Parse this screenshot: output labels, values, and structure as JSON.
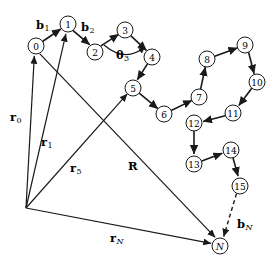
{
  "figure": {
    "width": 280,
    "height": 275,
    "background_color": "#ffffff",
    "stroke_color": "#1a1a1a"
  },
  "nodes": [
    {
      "id": "0",
      "label": "0",
      "cx": 36,
      "cy": 46,
      "r": 8
    },
    {
      "id": "1",
      "label": "1",
      "cx": 68,
      "cy": 24,
      "r": 8
    },
    {
      "id": "2",
      "label": "2",
      "cx": 95,
      "cy": 52,
      "r": 8
    },
    {
      "id": "3",
      "label": "3",
      "cx": 125,
      "cy": 30,
      "r": 8
    },
    {
      "id": "4",
      "label": "4",
      "cx": 152,
      "cy": 57,
      "r": 8
    },
    {
      "id": "5",
      "label": "5",
      "cx": 133,
      "cy": 88,
      "r": 8
    },
    {
      "id": "6",
      "label": "6",
      "cx": 164,
      "cy": 114,
      "r": 8
    },
    {
      "id": "7",
      "label": "7",
      "cx": 199,
      "cy": 97,
      "r": 8
    },
    {
      "id": "8",
      "label": "8",
      "cx": 207,
      "cy": 59,
      "r": 8
    },
    {
      "id": "9",
      "label": "9",
      "cx": 245,
      "cy": 45,
      "r": 8
    },
    {
      "id": "10",
      "label": "10",
      "cx": 257,
      "cy": 82,
      "r": 8
    },
    {
      "id": "11",
      "label": "11",
      "cx": 233,
      "cy": 113,
      "r": 8
    },
    {
      "id": "12",
      "label": "12",
      "cx": 194,
      "cy": 123,
      "r": 8
    },
    {
      "id": "13",
      "label": "13",
      "cx": 194,
      "cy": 164,
      "r": 8
    },
    {
      "id": "14",
      "label": "14",
      "cx": 231,
      "cy": 150,
      "r": 8
    },
    {
      "id": "15",
      "label": "15",
      "cx": 240,
      "cy": 186,
      "r": 8
    },
    {
      "id": "N",
      "label": "N",
      "cx": 220,
      "cy": 246,
      "r": 8,
      "italic": true
    }
  ],
  "bonds": [
    {
      "from": "0",
      "to": "1",
      "style": "solid"
    },
    {
      "from": "1",
      "to": "2",
      "style": "solid"
    },
    {
      "from": "2",
      "to": "3",
      "style": "solid"
    },
    {
      "from": "3",
      "to": "4",
      "style": "solid"
    },
    {
      "from": "4",
      "to": "5",
      "style": "solid"
    },
    {
      "from": "5",
      "to": "6",
      "style": "solid"
    },
    {
      "from": "6",
      "to": "7",
      "style": "solid"
    },
    {
      "from": "7",
      "to": "8",
      "style": "solid"
    },
    {
      "from": "8",
      "to": "9",
      "style": "solid"
    },
    {
      "from": "9",
      "to": "10",
      "style": "solid"
    },
    {
      "from": "10",
      "to": "11",
      "style": "solid"
    },
    {
      "from": "11",
      "to": "12",
      "style": "solid"
    },
    {
      "from": "12",
      "to": "13",
      "style": "solid"
    },
    {
      "from": "13",
      "to": "14",
      "style": "solid"
    },
    {
      "from": "14",
      "to": "15",
      "style": "solid"
    },
    {
      "from": "15",
      "to": "N",
      "style": "dashed"
    }
  ],
  "origin": {
    "x": 26,
    "y": 208
  },
  "vectors": [
    {
      "id": "r0",
      "from_origin": true,
      "to_node": "0",
      "label": "r",
      "sub": "0"
    },
    {
      "id": "r1",
      "from_origin": true,
      "to_node": "1",
      "label": "r",
      "sub": "1"
    },
    {
      "id": "r5",
      "from_origin": true,
      "to_node": "5",
      "label": "r",
      "sub": "5"
    },
    {
      "id": "rN",
      "from_origin": true,
      "to_node": "N",
      "label": "r",
      "sub": "N"
    },
    {
      "id": "R",
      "from_node": "0",
      "to_node": "N",
      "label": "R",
      "sub": ""
    }
  ],
  "labels": {
    "b1": {
      "base": "b",
      "sub": "1",
      "x": 36,
      "y": 20,
      "sub_italic": false
    },
    "b2": {
      "base": "b",
      "sub": "2",
      "x": 81,
      "y": 22,
      "sub_italic": false
    },
    "bN": {
      "base": "b",
      "sub": "N",
      "x": 237,
      "y": 219,
      "sub_italic": true
    },
    "theta3": {
      "base": "θ",
      "sub": "3",
      "x": 116,
      "y": 50,
      "sub_italic": false
    },
    "r0": {
      "base": "r",
      "sub": "0",
      "x": 10,
      "y": 112,
      "sub_italic": false
    },
    "r1": {
      "base": "r",
      "sub": "1",
      "x": 41,
      "y": 137,
      "sub_italic": false
    },
    "r5": {
      "base": "r",
      "sub": "5",
      "x": 70,
      "y": 163,
      "sub_italic": false
    },
    "rN": {
      "base": "r",
      "sub": "N",
      "x": 110,
      "y": 233,
      "sub_italic": true
    },
    "R": {
      "base": "R",
      "sub": "",
      "x": 128,
      "y": 161,
      "sub_italic": false
    }
  },
  "angle_marker": {
    "name": "theta3-arc",
    "center_node": "3",
    "path": "M 104 45 Q 125 62 146 48"
  }
}
